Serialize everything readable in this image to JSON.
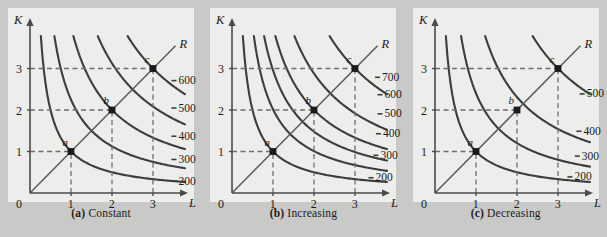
{
  "figure": {
    "background_color": "#c9c9c7",
    "plot_background_color": "#ededeb",
    "curve_color": "#3d3d3d",
    "axis_color": "#4a4a4a",
    "dashed_color": "#6e6e6e",
    "point_color": "#1a1a1a"
  },
  "panels": [
    {
      "id": "panel-a",
      "caption_tag": "(a)",
      "caption_text": "Constant",
      "axis": {
        "y_label": "K",
        "x_label": "L",
        "origin_label": "0",
        "y_ticks": [
          "1",
          "2",
          "3"
        ],
        "x_ticks": [
          "1",
          "2",
          "3"
        ]
      },
      "ray_label": "R",
      "points": [
        {
          "label": "a",
          "x": 1,
          "y": 1
        },
        {
          "label": "b",
          "x": 2,
          "y": 2
        },
        {
          "label": "c",
          "x": 3,
          "y": 3
        }
      ],
      "isoquant_labels": [
        "600",
        "500",
        "400",
        "300",
        "200"
      ]
    },
    {
      "id": "panel-b",
      "caption_tag": "(b)",
      "caption_text": "Increasing",
      "axis": {
        "y_label": "K",
        "x_label": "L",
        "origin_label": "0",
        "y_ticks": [
          "1",
          "2",
          "3"
        ],
        "x_ticks": [
          "1",
          "2",
          "3"
        ]
      },
      "ray_label": "R",
      "points": [
        {
          "label": "a",
          "x": 1,
          "y": 1
        },
        {
          "label": "b",
          "x": 2,
          "y": 2
        },
        {
          "label": "c",
          "x": 3,
          "y": 3
        }
      ],
      "isoquant_labels": [
        "700",
        "600",
        "500",
        "400",
        "300",
        "200"
      ]
    },
    {
      "id": "panel-c",
      "caption_tag": "(c)",
      "caption_text": "Decreasing",
      "axis": {
        "y_label": "K",
        "x_label": "L",
        "origin_label": "0",
        "y_ticks": [
          "1",
          "2",
          "3"
        ],
        "x_ticks": [
          "1",
          "2",
          "3"
        ]
      },
      "ray_label": "R",
      "points": [
        {
          "label": "a",
          "x": 1,
          "y": 1
        },
        {
          "label": "b",
          "x": 2,
          "y": 2
        },
        {
          "label": "c",
          "x": 3,
          "y": 3
        }
      ],
      "isoquant_labels": [
        "500",
        "400",
        "300",
        "200"
      ]
    }
  ],
  "chart_data": {
    "type": "line",
    "xlabel": "L",
    "ylabel": "K",
    "xlim": [
      0,
      4
    ],
    "ylim": [
      0,
      4
    ],
    "grid": false,
    "legend": "inline curve labels at right of each isoquant",
    "annotations": [
      "R = expansion ray through origin with slope 1"
    ],
    "charts": [
      {
        "panel": "(a) Constant",
        "description": "Isoquants equally spaced along the ray R; doubling inputs doubles output.",
        "ray": {
          "name": "R",
          "from": [
            0,
            0
          ],
          "to": [
            3.55,
            3.55
          ]
        },
        "marked_points": [
          {
            "name": "a",
            "L": 1,
            "K": 1,
            "output": 200
          },
          {
            "name": "b",
            "L": 2,
            "K": 2,
            "output": 400
          },
          {
            "name": "c",
            "L": 3,
            "K": 3,
            "output": 600
          }
        ],
        "isoquants": [
          {
            "output": 200,
            "k_scale": 1.0,
            "label_pos": [
              3.62,
              0.3
            ]
          },
          {
            "output": 300,
            "k_scale": 1.5,
            "label_pos": [
              3.62,
              0.82
            ]
          },
          {
            "output": 400,
            "k_scale": 2.0,
            "label_pos": [
              3.62,
              1.38
            ]
          },
          {
            "output": 500,
            "k_scale": 2.5,
            "label_pos": [
              3.62,
              2.06
            ]
          },
          {
            "output": 600,
            "k_scale": 3.0,
            "label_pos": [
              3.62,
              2.72
            ]
          }
        ]
      },
      {
        "panel": "(b) Increasing",
        "description": "Isoquants get closer together along the ray R; doubling inputs more than doubles output.",
        "ray": {
          "name": "R",
          "from": [
            0,
            0
          ],
          "to": [
            3.55,
            3.55
          ]
        },
        "marked_points": [
          {
            "name": "a",
            "L": 1,
            "K": 1,
            "output": 200
          },
          {
            "name": "b",
            "L": 2,
            "K": 2,
            "output": 500
          },
          {
            "name": "c",
            "L": 3,
            "K": 3,
            "output": 700
          }
        ],
        "isoquants": [
          {
            "output": 200,
            "k_scale": 1.0,
            "label_pos": [
              3.5,
              0.38
            ]
          },
          {
            "output": 300,
            "k_scale": 1.42,
            "label_pos": [
              3.62,
              0.92
            ]
          },
          {
            "output": 400,
            "k_scale": 1.72,
            "label_pos": [
              3.68,
              1.44
            ]
          },
          {
            "output": 500,
            "k_scale": 2.0,
            "label_pos": [
              3.72,
              1.92
            ]
          },
          {
            "output": 600,
            "k_scale": 2.4,
            "label_pos": [
              3.72,
              2.38
            ]
          },
          {
            "output": 700,
            "k_scale": 3.0,
            "label_pos": [
              3.66,
              2.8
            ]
          }
        ]
      },
      {
        "panel": "(c) Decreasing",
        "description": "Isoquants get farther apart along the ray R; doubling inputs less than doubles output.",
        "ray": {
          "name": "R",
          "from": [
            0,
            0
          ],
          "to": [
            3.55,
            3.55
          ]
        },
        "marked_points": [
          {
            "name": "a",
            "L": 1,
            "K": 1,
            "output": 200
          },
          {
            "name": "b",
            "L": 2,
            "K": 2,
            "output": 300
          },
          {
            "name": "c",
            "L": 3,
            "K": 3,
            "output": 500
          }
        ],
        "isoquants": [
          {
            "output": 200,
            "k_scale": 1.0,
            "label_pos": [
              3.4,
              0.4
            ]
          },
          {
            "output": 300,
            "k_scale": 1.55,
            "label_pos": [
              3.58,
              0.9
            ]
          },
          {
            "output": 400,
            "k_scale": 2.15,
            "label_pos": [
              3.62,
              1.5
            ]
          },
          {
            "output": 500,
            "k_scale": 3.0,
            "label_pos": [
              3.7,
              2.4
            ]
          }
        ]
      }
    ]
  }
}
